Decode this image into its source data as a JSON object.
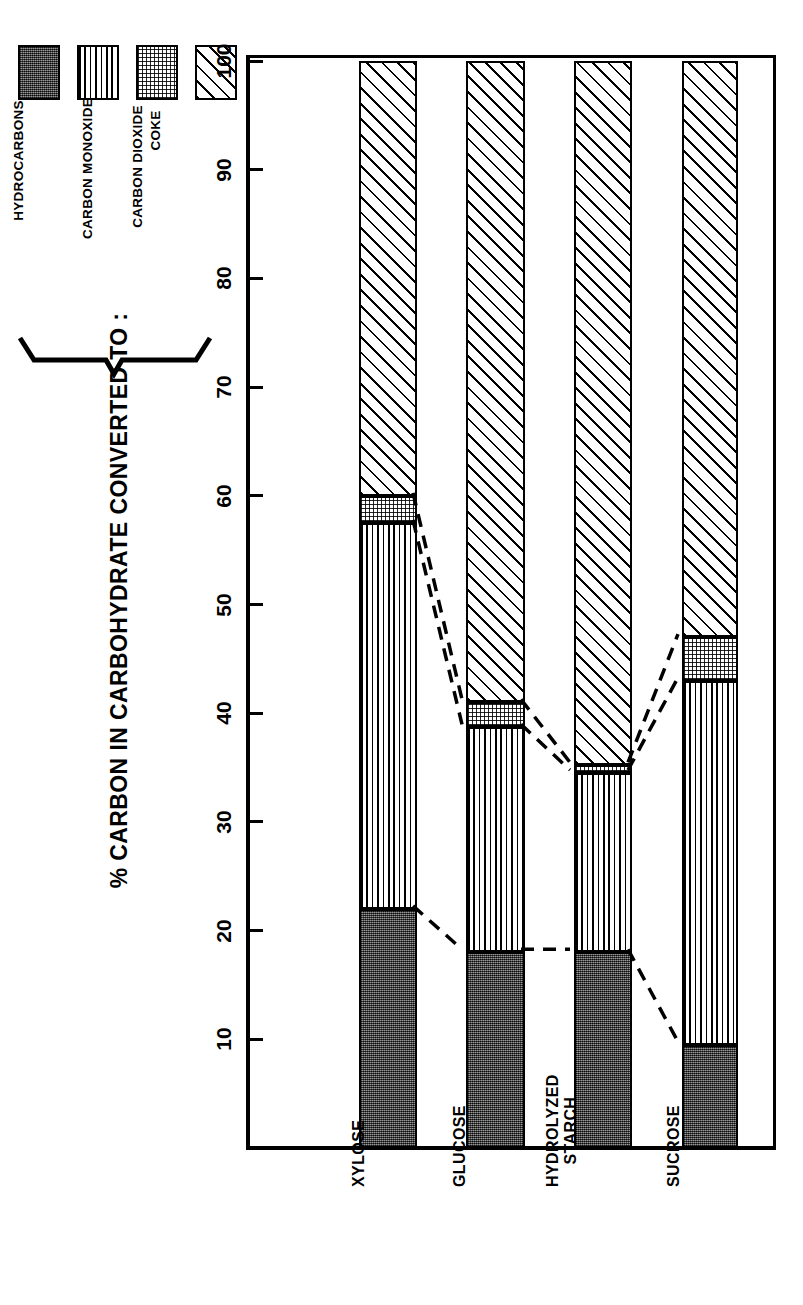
{
  "axis_title": "% CARBON IN CARBOHYDRATE CONVERTED TO :",
  "legend": {
    "items": [
      {
        "label": "HYDROCARBONS",
        "pattern": "dark-stipple",
        "key": "hydrocarbons"
      },
      {
        "label": "CARBON MONOXIDE",
        "pattern": "vertical-lines",
        "key": "carbon-monoxide"
      },
      {
        "label": "CARBON DIOXIDE",
        "pattern": "light-stipple",
        "key": "carbon-dioxide"
      },
      {
        "label": "COKE",
        "pattern": "diagonal-hatch",
        "key": "coke"
      }
    ]
  },
  "colors": {
    "ink": "#000000",
    "paper": "#ffffff",
    "hydrocarbons": "#4a4a4a",
    "carbon_monoxide": "#ffffff",
    "carbon_dioxide": "#ffffff",
    "coke": "#ffffff"
  },
  "chart_data": {
    "type": "bar",
    "subtype": "stacked-bar-horizontal-rotated",
    "title": "% CARBON IN CARBOHYDRATE CONVERTED TO :",
    "xlabel": "",
    "ylabel": "% CARBON IN CARBOHYDRATE CONVERTED TO :",
    "ylim": [
      0,
      100
    ],
    "yticks": [
      10,
      20,
      30,
      40,
      50,
      60,
      70,
      80,
      90,
      100
    ],
    "ytick_labels": [
      "10",
      "20",
      "30",
      "40",
      "50",
      "60",
      "70",
      "80",
      "90",
      "100"
    ],
    "grid": false,
    "legend_position": "top-left",
    "orientation": "rotated-90-ccw",
    "categories": [
      "XYLOSE",
      "GLUCOSE",
      "HYDROLYZED STARCH",
      "SUCROSE"
    ],
    "series": [
      {
        "name": "HYDROCARBONS",
        "values": [
          22.0,
          18.0,
          18.0,
          9.5
        ]
      },
      {
        "name": "CARBON MONOXIDE",
        "values": [
          35.5,
          20.7,
          16.5,
          33.5
        ]
      },
      {
        "name": "CARBON DIOXIDE",
        "values": [
          2.5,
          2.3,
          0.7,
          4.0
        ]
      },
      {
        "name": "COKE",
        "values": [
          40.0,
          59.0,
          64.8,
          53.0
        ]
      }
    ],
    "cumulative_boundaries": [
      {
        "category": "XYLOSE",
        "hydrocarbons_top": 22.0,
        "co_top": 57.5,
        "co2_top": 60.0,
        "coke_top": 100
      },
      {
        "category": "GLUCOSE",
        "hydrocarbons_top": 18.0,
        "co_top": 38.7,
        "co2_top": 41.0,
        "coke_top": 100
      },
      {
        "category": "HYDROLYZED STARCH",
        "hydrocarbons_top": 18.0,
        "co_top": 34.5,
        "co2_top": 35.2,
        "coke_top": 100
      },
      {
        "category": "SUCROSE",
        "hydrocarbons_top": 9.5,
        "co_top": 43.0,
        "co2_top": 47.0,
        "coke_top": 100
      }
    ],
    "connectors": "dashed lines joining equivalent segment boundaries between adjacent bars"
  }
}
